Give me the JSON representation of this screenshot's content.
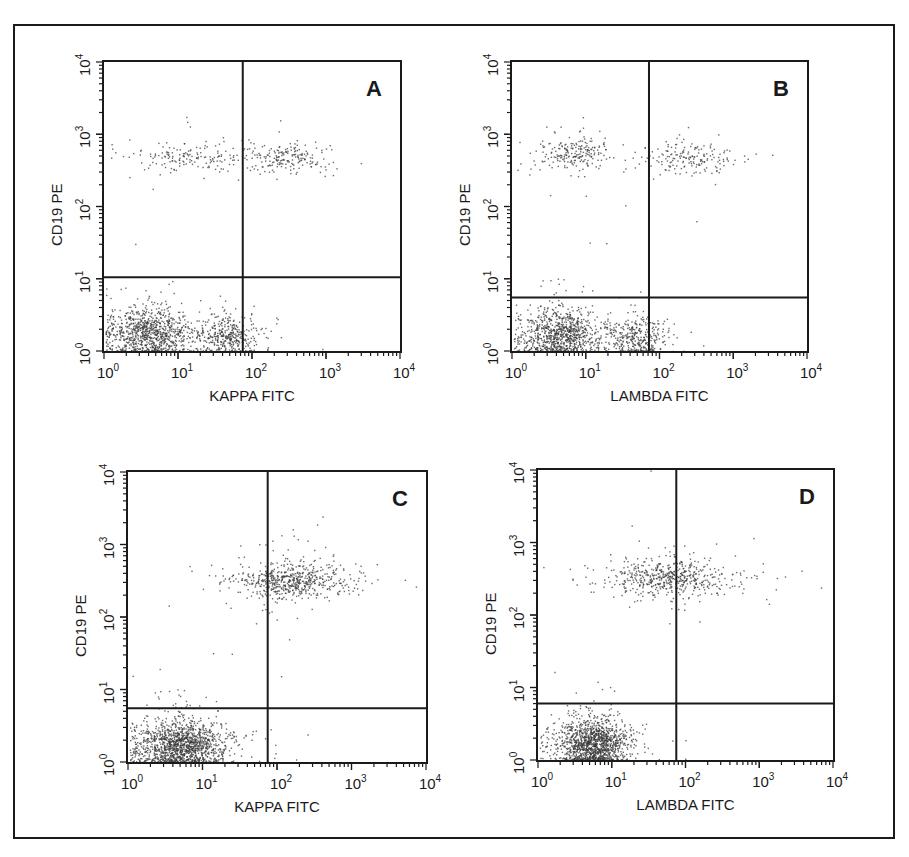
{
  "figure": {
    "frame_color": "#1a1a1a",
    "dot_color": "#3a3a3a"
  },
  "chart_data": [
    {
      "type": "scatter",
      "panel": "A",
      "title": "A",
      "xlabel": "KAPPA FITC",
      "ylabel": "CD19 PE",
      "xscale": "log",
      "yscale": "log",
      "xlim": [
        1,
        10000
      ],
      "ylim": [
        1,
        10000
      ],
      "x_ticks": [
        "10^0",
        "10^1",
        "10^2",
        "10^3",
        "10^4"
      ],
      "y_ticks": [
        "10^0",
        "10^1",
        "10^2",
        "10^3",
        "10^4"
      ],
      "quadrant_gate": {
        "x": 75,
        "y": 10.5
      },
      "box": {
        "left": 102,
        "top": 60,
        "width": 300,
        "height": 293
      },
      "clusters": [
        {
          "name": "CD19-negative low",
          "cx": 4,
          "cy": 1.8,
          "sx": 0.28,
          "sy": 0.18,
          "n": 900
        },
        {
          "name": "CD19-negative mid",
          "cx": 45,
          "cy": 1.6,
          "sx": 0.22,
          "sy": 0.15,
          "n": 380
        },
        {
          "name": "CD19+ kappa-neg",
          "cx": 12,
          "cy": 500,
          "sx": 0.35,
          "sy": 0.1,
          "n": 160
        },
        {
          "name": "CD19+ kappa-pos",
          "cx": 300,
          "cy": 480,
          "sx": 0.3,
          "sy": 0.1,
          "n": 200
        }
      ]
    },
    {
      "type": "scatter",
      "panel": "B",
      "title": "B",
      "xlabel": "LAMBDA FITC",
      "ylabel": "CD19 PE",
      "xscale": "log",
      "yscale": "log",
      "xlim": [
        1,
        10000
      ],
      "ylim": [
        1,
        10000
      ],
      "x_ticks": [
        "10^0",
        "10^1",
        "10^2",
        "10^3",
        "10^4"
      ],
      "y_ticks": [
        "10^0",
        "10^1",
        "10^2",
        "10^3",
        "10^4"
      ],
      "quadrant_gate": {
        "x": 72,
        "y": 5.5
      },
      "box": {
        "left": 510,
        "top": 60,
        "width": 299,
        "height": 293
      },
      "clusters": [
        {
          "name": "CD19-negative low",
          "cx": 4.5,
          "cy": 1.7,
          "sx": 0.27,
          "sy": 0.17,
          "n": 900
        },
        {
          "name": "CD19-negative mid",
          "cx": 45,
          "cy": 1.5,
          "sx": 0.22,
          "sy": 0.15,
          "n": 330
        },
        {
          "name": "CD19+ lambda-neg",
          "cx": 7,
          "cy": 550,
          "sx": 0.25,
          "sy": 0.12,
          "n": 220
        },
        {
          "name": "CD19+ lambda-pos",
          "cx": 250,
          "cy": 480,
          "sx": 0.3,
          "sy": 0.11,
          "n": 180
        }
      ]
    },
    {
      "type": "scatter",
      "panel": "C",
      "title": "C",
      "xlabel": "KAPPA FITC",
      "ylabel": "CD19 PE",
      "xscale": "log",
      "yscale": "log",
      "xlim": [
        1,
        10000
      ],
      "ylim": [
        1,
        10000
      ],
      "x_ticks": [
        "10^0",
        "10^1",
        "10^2",
        "10^3",
        "10^4"
      ],
      "y_ticks": [
        "10^0",
        "10^1",
        "10^2",
        "10^3",
        "10^4"
      ],
      "quadrant_gate": {
        "x": 75,
        "y": 5.5
      },
      "box": {
        "left": 126,
        "top": 470,
        "width": 302,
        "height": 294
      },
      "clusters": [
        {
          "name": "CD19-negative",
          "cx": 5,
          "cy": 1.7,
          "sx": 0.3,
          "sy": 0.17,
          "n": 1400
        },
        {
          "name": "CD19+ kappa-pos (dominant)",
          "cx": 150,
          "cy": 320,
          "sx": 0.38,
          "sy": 0.13,
          "n": 620
        }
      ]
    },
    {
      "type": "scatter",
      "panel": "D",
      "title": "D",
      "xlabel": "LAMBDA FITC",
      "ylabel": "CD19 PE",
      "xscale": "log",
      "yscale": "log",
      "xlim": [
        1,
        10000
      ],
      "ylim": [
        1,
        10000
      ],
      "x_ticks": [
        "10^0",
        "10^1",
        "10^2",
        "10^3",
        "10^4"
      ],
      "y_ticks": [
        "10^0",
        "10^1",
        "10^2",
        "10^3",
        "10^4"
      ],
      "quadrant_gate": {
        "x": 75,
        "y": 6
      },
      "box": {
        "left": 536,
        "top": 468,
        "width": 299,
        "height": 294
      },
      "clusters": [
        {
          "name": "CD19-negative",
          "cx": 5.5,
          "cy": 1.7,
          "sx": 0.23,
          "sy": 0.17,
          "n": 1300
        },
        {
          "name": "CD19+ lambda-neg/pos",
          "cx": 55,
          "cy": 330,
          "sx": 0.42,
          "sy": 0.13,
          "n": 560
        }
      ]
    }
  ]
}
